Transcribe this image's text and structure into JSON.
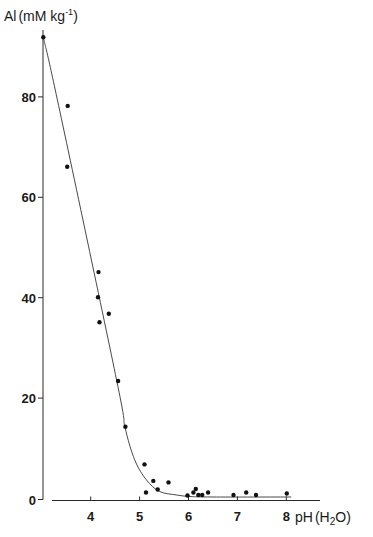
{
  "chart_data": {
    "type": "scatter",
    "title": "",
    "xlabel": "pH (H2O)",
    "ylabel": "Al (mM kg-1)",
    "xlabel_parts": {
      "main": "pH",
      "paren_open": "(",
      "h": "H",
      "sub": "2",
      "o": "O",
      "paren_close": ")"
    },
    "ylabel_parts": {
      "main": "Al",
      "unit": "(mM kg",
      "sup": "-1",
      "close": ")"
    },
    "xlim": [
      3.0,
      8.7
    ],
    "ylim": [
      0,
      92
    ],
    "x_ticks": [
      4,
      5,
      6,
      7,
      8
    ],
    "x_tick_labels": [
      "4",
      "5",
      "6",
      "7",
      "8"
    ],
    "y_ticks": [
      0,
      20,
      40,
      60,
      80
    ],
    "y_tick_labels": [
      "0",
      "20",
      "40",
      "60",
      "80"
    ],
    "grid": false,
    "legend": null,
    "series": [
      {
        "name": "observations",
        "kind": "scatter",
        "points": [
          {
            "x": 3.03,
            "y": 91.9
          },
          {
            "x": 3.53,
            "y": 78.2
          },
          {
            "x": 3.52,
            "y": 66.1
          },
          {
            "x": 4.16,
            "y": 45.1
          },
          {
            "x": 4.15,
            "y": 40.1
          },
          {
            "x": 4.18,
            "y": 35.1
          },
          {
            "x": 4.37,
            "y": 36.8
          },
          {
            "x": 4.56,
            "y": 23.4
          },
          {
            "x": 4.71,
            "y": 14.3
          },
          {
            "x": 5.1,
            "y": 6.8
          },
          {
            "x": 5.13,
            "y": 1.2
          },
          {
            "x": 5.28,
            "y": 3.5
          },
          {
            "x": 5.37,
            "y": 1.8
          },
          {
            "x": 5.59,
            "y": 3.2
          },
          {
            "x": 5.98,
            "y": 0.6
          },
          {
            "x": 6.1,
            "y": 1.2
          },
          {
            "x": 6.15,
            "y": 1.9
          },
          {
            "x": 6.2,
            "y": 0.7
          },
          {
            "x": 6.28,
            "y": 0.7
          },
          {
            "x": 6.4,
            "y": 1.2
          },
          {
            "x": 6.92,
            "y": 0.7
          },
          {
            "x": 7.18,
            "y": 1.2
          },
          {
            "x": 7.38,
            "y": 0.7
          },
          {
            "x": 8.01,
            "y": 1.0
          }
        ]
      },
      {
        "name": "fitted curve",
        "kind": "line",
        "points": [
          {
            "x": 3.03,
            "y": 91.9
          },
          {
            "x": 3.32,
            "y": 79.4
          },
          {
            "x": 4.53,
            "y": 23.6
          },
          {
            "x": 4.7,
            "y": 14.3
          },
          {
            "x": 4.9,
            "y": 7.7
          },
          {
            "x": 5.14,
            "y": 3.7
          },
          {
            "x": 5.41,
            "y": 1.4
          },
          {
            "x": 5.76,
            "y": 0.7
          },
          {
            "x": 6.03,
            "y": 0.4
          },
          {
            "x": 6.5,
            "y": 0.3
          },
          {
            "x": 8.1,
            "y": 0.3
          }
        ]
      }
    ]
  },
  "layout": {
    "x0_px": 90.7,
    "x0_val": 4,
    "px_per_x": 48.9,
    "y0_px": 498.5,
    "px_per_y": 5.02,
    "yaxis_x": 43,
    "yaxis_top": 30,
    "yaxis_bottom": 499.5,
    "xaxis_y": 500.5,
    "xaxis_left": 52,
    "xaxis_right": 320
  }
}
